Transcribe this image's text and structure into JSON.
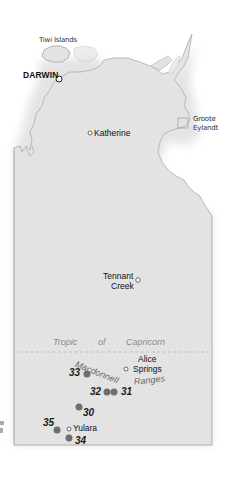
{
  "map": {
    "region": "Northern Territory",
    "colors": {
      "land": "#e3e3e3",
      "coast": "#9a9a9a",
      "sea": "#ffffff",
      "marker": "#6e6e6e",
      "tropic_line": "#bdbdbd"
    },
    "labels": {
      "tiwi": "Tiwi Islands",
      "darwin": "DARWIN",
      "groote_1": "Groote",
      "groote_2": "Eylandt",
      "katherine": "Katherine",
      "tennant_1": "Tennant",
      "tennant_2": "Creek",
      "tropic_1": "Tropic",
      "tropic_2": "of",
      "tropic_3": "Capricorn",
      "alice_1": "Alice",
      "alice_2": "Springs",
      "range_1": "Macdonnell",
      "range_2": "Ranges",
      "yulara": "Yulara"
    },
    "markers": [
      {
        "id": "33",
        "label": "33"
      },
      {
        "id": "32",
        "label": "32"
      },
      {
        "id": "31",
        "label": "31"
      },
      {
        "id": "30",
        "label": "30"
      },
      {
        "id": "35",
        "label": "35"
      },
      {
        "id": "34",
        "label": "34"
      }
    ]
  }
}
